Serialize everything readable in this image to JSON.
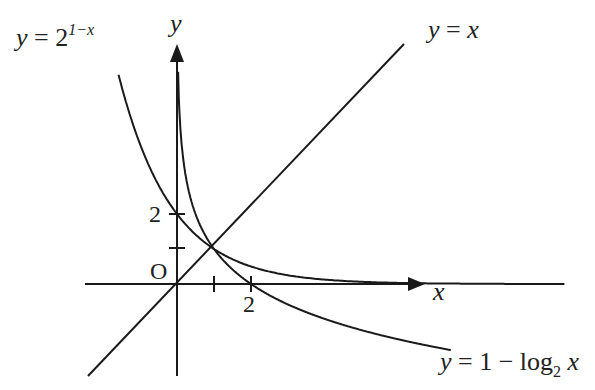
{
  "top_partial_text": "graph of y = f(x) ...",
  "axes": {
    "x_label": "x",
    "y_label": "y",
    "origin_label": "O",
    "x_ticks": [
      "",
      "2"
    ],
    "y_ticks": [
      "",
      "2"
    ]
  },
  "curves": {
    "exp": {
      "lhs": "y = 2",
      "sup": "1−x"
    },
    "line": {
      "label": "y = x"
    },
    "log": {
      "lhs": "y = 1 − log",
      "sub": "2",
      "rhs": " x"
    }
  },
  "chart_data": {
    "type": "line",
    "title": "",
    "xlabel": "x",
    "ylabel": "y",
    "series": [
      {
        "name": "y = 2^(1-x)",
        "x": [
          -2,
          -1,
          0,
          1,
          2,
          3,
          4,
          5,
          6
        ],
        "y": [
          8,
          4,
          2,
          1,
          0.5,
          0.25,
          0.125,
          0.0625,
          0.03125
        ]
      },
      {
        "name": "y = x",
        "x": [
          -2.5,
          0,
          6.2
        ],
        "y": [
          -2.5,
          0,
          6.9
        ]
      },
      {
        "name": "y = 1 - log2 x",
        "x": [
          0.0625,
          0.125,
          0.25,
          0.5,
          1,
          2,
          4,
          8
        ],
        "y": [
          5,
          4,
          3,
          2,
          1,
          0,
          -1,
          -2
        ]
      }
    ],
    "annotations": [
      "O",
      "y = 2^(1-x)",
      "y = x",
      "y = 1 - log2 x"
    ],
    "intersection": {
      "x": 1,
      "y": 1
    },
    "tick_labels": {
      "x": [
        1,
        2
      ],
      "y": [
        1,
        2
      ],
      "labeled_x": [
        "2"
      ],
      "labeled_y": [
        "2"
      ]
    },
    "grid": false
  }
}
